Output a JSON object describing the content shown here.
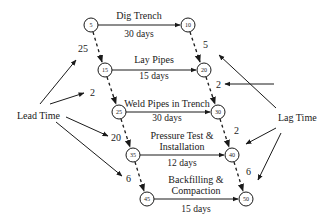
{
  "diagram": {
    "nodes": [
      {
        "id": "5",
        "label": "5",
        "x": 91,
        "y": 25
      },
      {
        "id": "10",
        "label": "10",
        "x": 188,
        "y": 25
      },
      {
        "id": "15",
        "label": "15",
        "x": 105,
        "y": 70
      },
      {
        "id": "20",
        "label": "20",
        "x": 204,
        "y": 70
      },
      {
        "id": "25",
        "label": "25",
        "x": 119,
        "y": 112
      },
      {
        "id": "30",
        "label": "30",
        "x": 218,
        "y": 112
      },
      {
        "id": "35",
        "label": "35",
        "x": 133,
        "y": 155
      },
      {
        "id": "40",
        "label": "40",
        "x": 232,
        "y": 155
      },
      {
        "id": "45",
        "label": "45",
        "x": 147,
        "y": 199
      },
      {
        "id": "50",
        "label": "50",
        "x": 246,
        "y": 199
      }
    ],
    "activities": [
      {
        "name": "Dig Trench",
        "duration": "30 days",
        "from": "5",
        "to": "10"
      },
      {
        "name": "Lay Pipes",
        "duration": "15 days",
        "from": "15",
        "to": "20"
      },
      {
        "name": "Weld Pipes in Trench",
        "duration": "30 days",
        "from": "25",
        "to": "30"
      },
      {
        "name_line1": "Pressure Test &",
        "name_line2": "Installation",
        "duration": "12 days",
        "from": "35",
        "to": "40"
      },
      {
        "name_line1": "Backfilling &",
        "name_line2": "Compaction",
        "duration": "15 days",
        "from": "45",
        "to": "50"
      }
    ],
    "lead_time": {
      "label": "Lead Time",
      "values": [
        "25",
        "2",
        "20",
        "6"
      ]
    },
    "lag_time": {
      "label": "Lag Time",
      "values": [
        "5",
        "2",
        "2",
        "6"
      ]
    }
  }
}
